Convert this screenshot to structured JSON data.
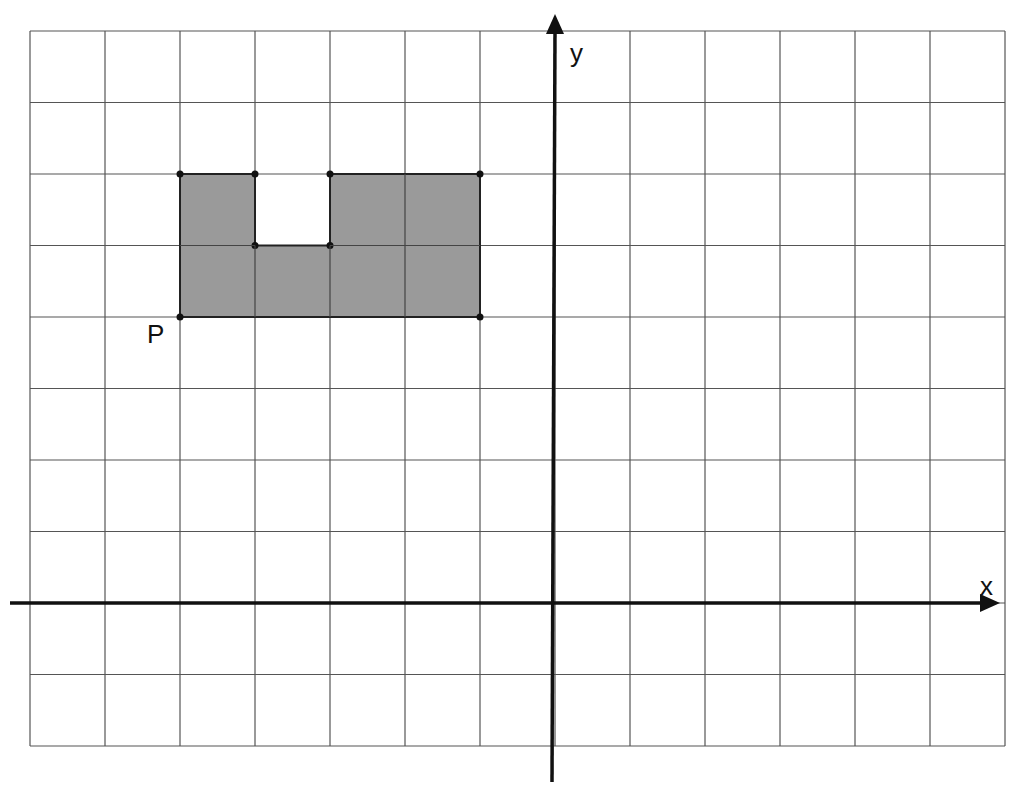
{
  "diagram": {
    "type": "coordinate-grid",
    "grid": {
      "x_min": -7,
      "x_max": 6,
      "y_min": -2,
      "y_max": 8,
      "origin_px": [
        555,
        603
      ],
      "cell_w": 75,
      "cell_h": 71.5,
      "line_color": "#555555"
    },
    "axes": {
      "x_label": "x",
      "y_label": "y",
      "color": "#111111"
    },
    "shape": {
      "fill": "#9a9a9a",
      "stroke": "#222222",
      "vertices": [
        [
          -5,
          4
        ],
        [
          -5,
          6
        ],
        [
          -4,
          6
        ],
        [
          -4,
          5
        ],
        [
          -3,
          5
        ],
        [
          -3,
          6
        ],
        [
          -1,
          6
        ],
        [
          -1,
          4
        ]
      ]
    },
    "points": [
      {
        "label": "P",
        "x": -5,
        "y": 4
      }
    ]
  }
}
